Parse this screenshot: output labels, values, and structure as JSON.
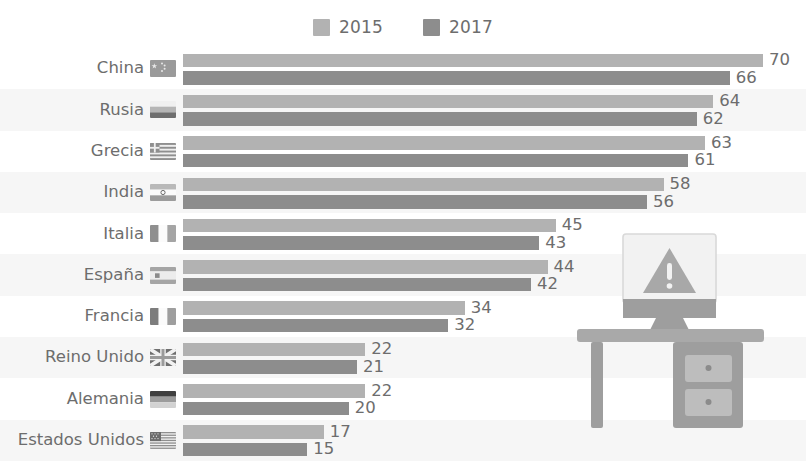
{
  "legend": {
    "items": [
      {
        "label": "2015",
        "color": "#b2b2b2",
        "icon": "legend-swatch-2015"
      },
      {
        "label": "2017",
        "color": "#8d8d8d",
        "icon": "legend-swatch-2017"
      }
    ]
  },
  "illustration": {
    "name": "desk-with-monitor-warning",
    "monitor_icon": "warning-triangle-icon",
    "desk_icon": "desk-icon"
  },
  "chart_data": {
    "type": "bar",
    "orientation": "horizontal",
    "title": "",
    "xlabel": "",
    "ylabel": "",
    "xlim": [
      0,
      70
    ],
    "grid": false,
    "legend_position": "top-center",
    "categories": [
      "China",
      "Rusia",
      "Grecia",
      "India",
      "Italia",
      "España",
      "Francia",
      "Reino Unido",
      "Alemania",
      "Estados Unidos"
    ],
    "category_flags": [
      "china-flag",
      "russia-flag",
      "greece-flag",
      "india-flag",
      "italy-flag",
      "spain-flag",
      "france-flag",
      "united-kingdom-flag",
      "germany-flag",
      "united-states-flag"
    ],
    "series": [
      {
        "name": "2015",
        "color": "#b2b2b2",
        "values": [
          70,
          64,
          63,
          58,
          45,
          44,
          34,
          22,
          22,
          17
        ]
      },
      {
        "name": "2017",
        "color": "#8d8d8d",
        "values": [
          66,
          62,
          61,
          56,
          43,
          42,
          32,
          21,
          20,
          15
        ]
      }
    ]
  }
}
